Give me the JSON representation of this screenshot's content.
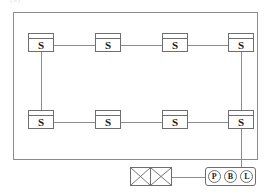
{
  "diagram": {
    "caption_artifact": "(a)",
    "enclosure": {
      "name": "system-enclosure"
    },
    "switches": [
      {
        "id": "s-top-1",
        "label": "S",
        "x": 28,
        "y": 33
      },
      {
        "id": "s-top-2",
        "label": "S",
        "x": 95,
        "y": 33
      },
      {
        "id": "s-top-3",
        "label": "S",
        "x": 162,
        "y": 33
      },
      {
        "id": "s-top-4",
        "label": "S",
        "x": 228,
        "y": 33
      },
      {
        "id": "s-bottom-1",
        "label": "S",
        "x": 28,
        "y": 110
      },
      {
        "id": "s-bottom-2",
        "label": "S",
        "x": 95,
        "y": 110
      },
      {
        "id": "s-bottom-3",
        "label": "S",
        "x": 162,
        "y": 110
      },
      {
        "id": "s-bottom-4",
        "label": "S",
        "x": 228,
        "y": 110
      }
    ],
    "links_horizontal": [
      {
        "id": "link-top-1-2",
        "x": 54,
        "y": 45,
        "width": 41
      },
      {
        "id": "link-top-2-3",
        "x": 121,
        "y": 45,
        "width": 41
      },
      {
        "id": "link-top-3-4",
        "x": 188,
        "y": 45,
        "width": 40
      },
      {
        "id": "link-bottom-1-2",
        "x": 54,
        "y": 122,
        "width": 41
      },
      {
        "id": "link-bottom-2-3",
        "x": 121,
        "y": 122,
        "width": 41
      },
      {
        "id": "link-bottom-3-4",
        "x": 188,
        "y": 122,
        "width": 40
      },
      {
        "id": "link-xbox-to-pbl",
        "x": 172,
        "y": 177,
        "width": 33
      }
    ],
    "links_vertical": [
      {
        "id": "link-left-column",
        "x": 41,
        "y": 52,
        "height": 58
      },
      {
        "id": "link-right-column",
        "x": 241,
        "y": 52,
        "height": 58
      },
      {
        "id": "link-uplink",
        "x": 241,
        "y": 129,
        "height": 48
      }
    ],
    "crossed_box": {
      "id": "crossed-switch-box",
      "cells": [
        "cross-cell-left",
        "cross-cell-right"
      ]
    },
    "device_group": {
      "id": "pbl-device-group",
      "nodes": [
        {
          "id": "node-p",
          "label": "P"
        },
        {
          "id": "node-b",
          "label": "B"
        },
        {
          "id": "node-l",
          "label": "L"
        }
      ]
    }
  }
}
